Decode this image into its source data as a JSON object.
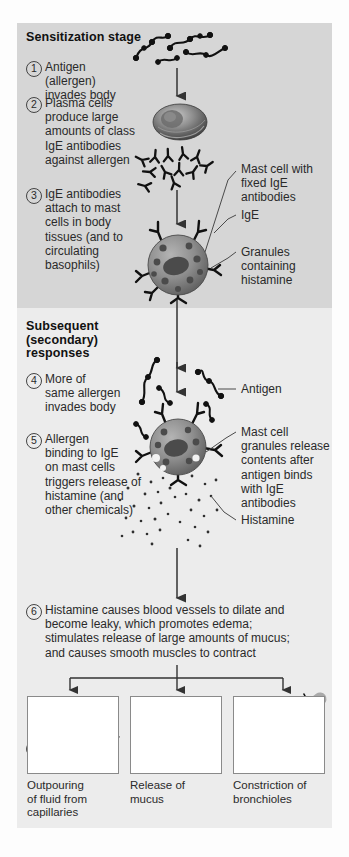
{
  "diagram": {
    "sections": [
      {
        "id": "sensitization",
        "heading": "Sensitization stage"
      },
      {
        "id": "subsequent",
        "heading": "Subsequent\n(secondary)\nresponses"
      }
    ],
    "steps": [
      {
        "number": "1",
        "text": "Antigen (allergen)\ninvades body"
      },
      {
        "number": "2",
        "text": "Plasma cells\nproduce large\namounts of class\nIgE antibodies\nagainst allergen"
      },
      {
        "number": "3",
        "text": "IgE antibodies\nattach to mast\ncells in body\ntissues (and to\ncirculating\nbasophils)"
      },
      {
        "number": "4",
        "text": "More of\nsame allergen\ninvades body"
      },
      {
        "number": "5",
        "text": "Allergen\nbinding to IgE\non mast cells\ntriggers release of\nhistamine (and\nother chemicals)"
      },
      {
        "number": "6",
        "text": "Histamine causes blood vessels to dilate and\nbecome leaky, which promotes edema;\nstimulates release of large amounts of mucus;\nand causes smooth muscles to contract"
      }
    ],
    "callouts": [
      {
        "id": "mast-cell-fixed-ige",
        "text": "Mast cell with\nfixed IgE\nantibodies"
      },
      {
        "id": "ige",
        "text": "IgE"
      },
      {
        "id": "granules-histamine",
        "text": "Granules\ncontaining\nhistamine"
      },
      {
        "id": "antigen",
        "text": "Antigen"
      },
      {
        "id": "mast-cell-release",
        "text": "Mast cell\ngranules release\ncontents after\nantigen binds\nwith IgE\nantibodies"
      },
      {
        "id": "histamine",
        "text": "Histamine"
      }
    ],
    "outcomes": [
      {
        "id": "capillaries",
        "caption": "Outpouring\nof fluid from\ncapillaries"
      },
      {
        "id": "mucus",
        "caption": "Release of\nmucus"
      },
      {
        "id": "bronchioles",
        "caption": "Constriction of\nbronchioles"
      }
    ],
    "colors": {
      "stage1_background": "#d6d6d6",
      "stage2_background": "#ececec",
      "page_background": "#fdfdfd",
      "text": "#2a2a2a",
      "arrow": "#333333",
      "cell_body": "#8d8d8d",
      "granule": "#4b4b4b",
      "vessel": "#7b7b7b"
    }
  }
}
